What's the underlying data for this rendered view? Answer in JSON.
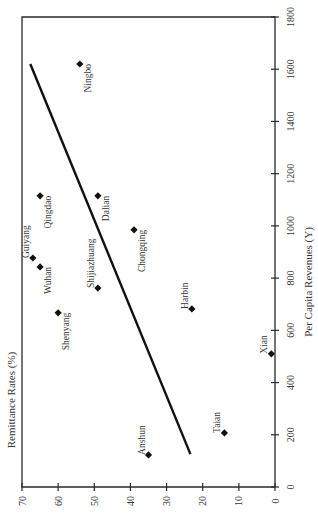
{
  "chart_data": {
    "type": "scatter",
    "orientation_note": "figure rotated 90 degrees counter-clockwise",
    "title": "",
    "xlabel": "Per Capita Revenues (Y)",
    "ylabel": "Remittance Rates (%)",
    "xlim": [
      0,
      1800
    ],
    "ylim": [
      0,
      70
    ],
    "x_ticks": [
      0,
      200,
      400,
      600,
      800,
      1000,
      1200,
      1400,
      1600,
      1800
    ],
    "y_ticks": [
      0,
      10,
      20,
      30,
      40,
      50,
      60,
      70
    ],
    "grid": false,
    "legend": null,
    "points": [
      {
        "label": "Ningbo",
        "x": 1620,
        "y": 54
      },
      {
        "label": "Qingdao",
        "x": 1115,
        "y": 65
      },
      {
        "label": "Dalian",
        "x": 1115,
        "y": 49
      },
      {
        "label": "Chongqing",
        "x": 985,
        "y": 39
      },
      {
        "label": "Guiyang",
        "x": 877,
        "y": 67
      },
      {
        "label": "Wuhan",
        "x": 843,
        "y": 65
      },
      {
        "label": "Shijiazhuang",
        "x": 762,
        "y": 49
      },
      {
        "label": "Harbin",
        "x": 682,
        "y": 23
      },
      {
        "label": "Shenyang",
        "x": 667,
        "y": 60
      },
      {
        "label": "Xian",
        "x": 510,
        "y": 1
      },
      {
        "label": "Taian",
        "x": 207,
        "y": 14
      },
      {
        "label": "Anshun",
        "x": 123,
        "y": 35
      }
    ],
    "trendline": {
      "type": "linear",
      "start": {
        "x": 126,
        "y": 23.4
      },
      "end": {
        "x": 1620,
        "y": 67.7
      }
    }
  },
  "axes": {
    "x_title": "Per Capita Revenues (Y)",
    "y_title": "Remittance Rates (%)"
  }
}
